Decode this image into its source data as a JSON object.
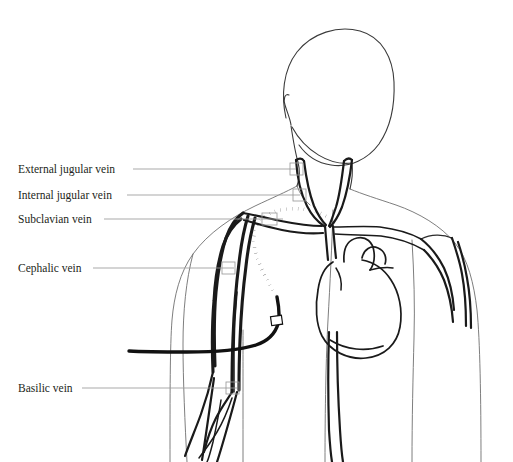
{
  "figure": {
    "width": 513,
    "height": 462,
    "background_color": "#ffffff",
    "ink_color": "#1a1a1a",
    "outline_color": "#6f6f6f",
    "leader_color": "#9a9a9a",
    "catheter_color": "#111111"
  },
  "labels": [
    {
      "id": "external-jugular-vein",
      "text": "External jugular vein",
      "text_x": 18,
      "text_y": 164,
      "leader_start_x": 133,
      "leader_start_y": 169,
      "leader_end_x": 296,
      "leader_end_y": 169,
      "marker_x": 290,
      "marker_y": 163,
      "marker_w": 13,
      "marker_h": 12
    },
    {
      "id": "internal-jugular-vein",
      "text": "Internal jugular vein",
      "text_x": 18,
      "text_y": 190,
      "leader_start_x": 127,
      "leader_start_y": 195,
      "leader_end_x": 300,
      "leader_end_y": 195,
      "marker_x": 293,
      "marker_y": 189,
      "marker_w": 13,
      "marker_h": 12
    },
    {
      "id": "subclavian-vein",
      "text": "Subclavian vein",
      "text_x": 18,
      "text_y": 214,
      "leader_start_x": 104,
      "leader_start_y": 219,
      "leader_end_x": 283,
      "leader_end_y": 219,
      "marker_x": 262,
      "marker_y": 213,
      "marker_w": 15,
      "marker_h": 12
    },
    {
      "id": "cephalic-vein",
      "text": "Cephalic vein",
      "text_x": 18,
      "text_y": 263,
      "leader_start_x": 93,
      "leader_start_y": 268,
      "leader_end_x": 234,
      "leader_end_y": 268,
      "marker_x": 222,
      "marker_y": 262,
      "marker_w": 13,
      "marker_h": 12
    },
    {
      "id": "basilic-vein",
      "text": "Basilic vein",
      "text_x": 18,
      "text_y": 383,
      "leader_start_x": 82,
      "leader_start_y": 388,
      "leader_end_x": 237,
      "leader_end_y": 388,
      "marker_x": 226,
      "marker_y": 382,
      "marker_w": 13,
      "marker_h": 12
    }
  ],
  "anatomy": {
    "head": {
      "name": "head-and-face-outline",
      "path": "M 286 118 C 281 96 283 70 297 52 C 312 33 338 25 360 31 C 382 37 393 58 394 82 C 395 106 390 128 379 144 C 368 159 350 168 331 165 C 317 163 306 155 299 145"
    },
    "ear": {
      "name": "ear-outline",
      "path": "M 289 95 C 285 93 283 99 285 105 C 287 112 290 118 291 125"
    },
    "jaw_neck_left": {
      "name": "neck-left-contour",
      "path": "M 291 126 C 293 139 295 152 298 162 C 300 170 300 178 297 186"
    },
    "jaw_neck_right": {
      "name": "neck-right-contour",
      "path": "M 352 163 C 353 172 352 181 350 189"
    },
    "chin_line": {
      "name": "chin-jaw-line",
      "path": "M 292 127 C 305 151 330 166 352 163"
    },
    "shoulders": {
      "name": "shoulder-and-torso-outline",
      "path": "M 297 186 C 286 192 272 198 255 206 C 232 217 208 233 193 254 C 180 272 174 296 172 320 C 170 346 170 392 170 462"
    },
    "shoulders_right": {
      "name": "shoulder-right-outline",
      "path": "M 350 189 C 362 194 378 199 396 205 C 419 213 441 226 455 243 C 468 259 474 284 477 310 C 480 340 481 398 481 462"
    },
    "neck_base_left": {
      "name": "neck-base-left",
      "path": "M 297 186 C 300 194 304 200 310 205"
    },
    "torso_inner_left": {
      "name": "torso-left-inner-contour",
      "path": "M 333 210 C 332 244 330 284 328 320 C 326 356 325 410 325 462"
    },
    "torso_inner_right": {
      "name": "torso-right-inner-contour",
      "path": "M 412 240 C 414 274 415 306 414 338 C 413 376 412 420 412 462"
    },
    "arm_left_outer": {
      "name": "left-arm-outer-contour",
      "path": "M 193 254 C 186 280 183 312 183 344 C 183 380 185 424 187 462"
    },
    "arm_left_inner": {
      "name": "left-arm-inner-contour",
      "path": "M 243 330 C 243 360 243 400 243 462"
    }
  },
  "vessels": {
    "external_jugular_left": {
      "name": "external-jugular-vein-left",
      "path": "M 296 160 C 297 176 300 192 307 206 C 312 216 318 222 324 226"
    },
    "internal_jugular_left": {
      "name": "internal-jugular-vein-left",
      "path": "M 304 161 C 306 177 309 193 314 206 C 318 215 322 221 326 225"
    },
    "jugular_left_apex": {
      "name": "jugular-left-apex-join",
      "path": "M 296 160 C 299 158 302 158 304 161"
    },
    "external_jugular_right": {
      "name": "external-jugular-vein-right",
      "path": "M 352 160 C 350 177 347 193 342 207 C 338 217 334 223 330 227"
    },
    "internal_jugular_right": {
      "name": "internal-jugular-vein-right",
      "path": "M 344 161 C 342 178 340 194 336 207 C 333 216 331 222 329 226"
    },
    "jugular_right_apex": {
      "name": "jugular-right-apex-join",
      "path": "M 344 161 C 347 158 350 158 352 160"
    },
    "svc_trunk": {
      "name": "superior-vena-cava",
      "path": "M 325 226 C 326 238 327 250 328 260"
    },
    "svc_trunk2": {
      "name": "superior-vena-cava-right-wall",
      "path": "M 333 226 C 334 238 335 250 336 258"
    },
    "subclavian_left": {
      "name": "subclavian-vein-left-upper",
      "path": "M 322 226 C 310 226 296 224 281 221 C 267 218 254 215 243 213"
    },
    "subclavian_left_lower": {
      "name": "subclavian-vein-left-lower",
      "path": "M 323 233 C 311 234 297 233 282 230 C 268 227 254 223 244 220"
    },
    "subclavian_right": {
      "name": "subclavian-vein-right-upper",
      "path": "M 334 227 C 348 227 364 226 380 227 C 396 229 410 233 421 239"
    },
    "subclavian_right_lower": {
      "name": "subclavian-vein-right-lower",
      "path": "M 335 234 C 349 235 365 235 381 236 C 397 238 412 243 424 250"
    },
    "axillary_left": {
      "name": "axillary-vein-left",
      "path": "M 243 213 C 236 218 230 226 226 238 C 221 253 218 272 216 292 C 214 314 214 340 215 366"
    },
    "cephalic_left": {
      "name": "cephalic-vein-left",
      "path": "M 241 219 C 233 225 227 234 223 246 C 218 262 215 281 214 301 C 212 324 212 348 213 372"
    },
    "basilic_left": {
      "name": "basilic-vein-left",
      "path": "M 248 216 C 244 229 241 245 239 263 C 236 286 234 312 233 338 C 232 360 232 378 232 392"
    },
    "basilic_left_2": {
      "name": "basilic-vein-left-medial",
      "path": "M 255 218 C 251 232 248 248 246 266 C 243 289 241 314 240 340 C 239 362 239 378 239 390"
    },
    "brachial_left": {
      "name": "brachial-vein-left",
      "path": "M 237 292 C 235 312 234 332 234 352 C 234 368 234 380 234 392"
    },
    "forearm_left_1": {
      "name": "forearm-vein-left-lateral",
      "path": "M 213 372 C 210 386 206 400 201 414 C 196 428 190 442 185 456"
    },
    "forearm_left_2": {
      "name": "forearm-vein-left-branch-a",
      "path": "M 214 378 C 212 392 210 406 208 420 C 206 434 204 448 202 460"
    },
    "forearm_left_3": {
      "name": "forearm-vein-left-branch-b",
      "path": "M 232 392 C 227 400 221 408 216 418 C 211 428 207 440 204 452"
    },
    "forearm_left_4": {
      "name": "forearm-vein-left-branch-c",
      "path": "M 237 392 C 234 404 230 418 226 432 C 222 446 219 456 217 462"
    },
    "forearm_left_5": {
      "name": "forearm-vein-left-branch-d",
      "path": "M 232 398 C 228 410 223 422 217 432 C 211 442 205 450 199 458"
    },
    "forearm_left_6": {
      "name": "forearm-vein-left-median",
      "path": "M 221 400 C 219 414 216 428 213 442 C 210 454 208 460 207 462"
    },
    "axillary_right": {
      "name": "axillary-vein-right",
      "path": "M 421 239 C 430 246 438 256 444 268 C 450 281 453 296 454 310"
    },
    "cephalic_right": {
      "name": "cephalic-vein-right",
      "path": "M 424 250 C 432 258 439 268 444 280 C 449 293 452 308 453 322"
    },
    "brachial_right": {
      "name": "brachial-vein-right",
      "path": "M 452 238 C 456 250 460 262 462 274 C 465 290 466 308 466 326"
    },
    "brachial_right_2": {
      "name": "brachial-vein-right-medial",
      "path": "M 458 242 C 462 254 465 266 467 278 C 470 294 471 310 471 328"
    },
    "axilla_right_apex": {
      "name": "axilla-right-apex",
      "path": "M 421 239 C 431 234 443 234 452 238"
    },
    "ivc_left": {
      "name": "inferior-vena-cava-left-wall",
      "path": "M 329 332 C 328 362 328 396 329 430 C 330 446 331 456 332 462"
    },
    "ivc_right": {
      "name": "inferior-vena-cava-right-wall",
      "path": "M 337 332 C 337 364 338 398 340 430 C 341 446 342 456 343 462"
    }
  },
  "heart": {
    "silhouette": {
      "name": "heart-silhouette",
      "path": "M 333 262 C 326 266 320 276 318 290 C 315 306 316 324 322 336 C 330 351 348 360 366 358 C 385 356 397 344 400 327 C 403 310 399 292 391 280 C 384 269 373 262 362 260"
    },
    "aortic_arch": {
      "name": "aortic-arch",
      "path": "M 344 262 C 343 248 348 240 357 238 C 366 236 373 242 374 252 C 375 260 373 266 370 270"
    },
    "pulmonary_artery": {
      "name": "pulmonary-artery",
      "path": "M 362 258 C 364 249 371 245 378 248 C 385 251 387 258 385 264"
    },
    "pa_branch": {
      "name": "pulmonary-artery-branch",
      "path": "M 370 270 C 378 268 386 267 393 268"
    },
    "ventricle_base": {
      "name": "ventricle-inferior-border",
      "path": "M 330 340 C 346 350 366 352 383 346"
    },
    "apex_detail": {
      "name": "heart-apex-detail",
      "path": "M 336 268 C 340 274 342 282 341 290"
    }
  },
  "catheter": {
    "dotted_segment": {
      "name": "catheter-intravascular-dotted-segment",
      "description": "catheter tip advanced through subclavian vein toward superior vena cava",
      "path": "M 326 216 C 316 210 302 208 288 209 C 274 210 263 215 258 223 C 252 233 253 247 258 260 C 263 274 271 287 277 297"
    },
    "solid_segment": {
      "name": "catheter-external-solid-tubing",
      "description": "external catheter tubing exiting at the upper arm insertion site",
      "path": "M 277 297 C 279 307 280 316 278 324 C 275 334 268 341 256 345 C 240 350 214 352 187 352 C 168 352 145 352 129 351"
    },
    "hub": {
      "name": "catheter-hub-clamp",
      "x": 271,
      "y": 316,
      "width": 11,
      "height": 9
    }
  }
}
